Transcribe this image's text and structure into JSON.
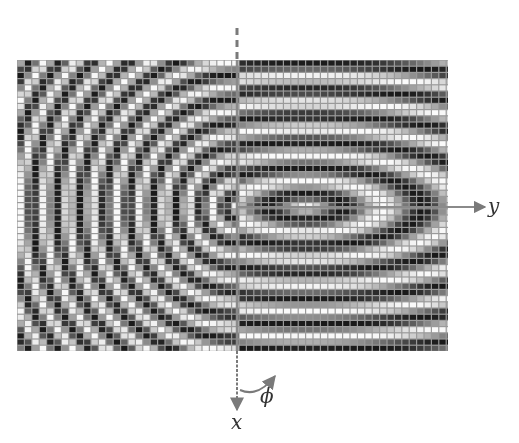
{
  "figure": {
    "labels": {
      "y_axis": "y",
      "x_axis": "x",
      "angle": "ϕ"
    },
    "grid": {
      "left": 17,
      "top": 60,
      "width": 431,
      "height": 291,
      "cell_w": 7.4,
      "cell_h": 6.2
    },
    "center": {
      "x": 236,
      "y": 207
    },
    "colors": {
      "axis": "#7a7a7a",
      "dark": "#1a1a1a",
      "light": "#f2f2f2",
      "label": "#333333"
    },
    "left_pattern": {
      "type": "concentric-rings",
      "period_px": 24
    },
    "right_pattern": {
      "type": "elliptical-fringes",
      "center_offset_x": 70,
      "period_px": 26,
      "ellipse_ratio": 3.0
    }
  }
}
